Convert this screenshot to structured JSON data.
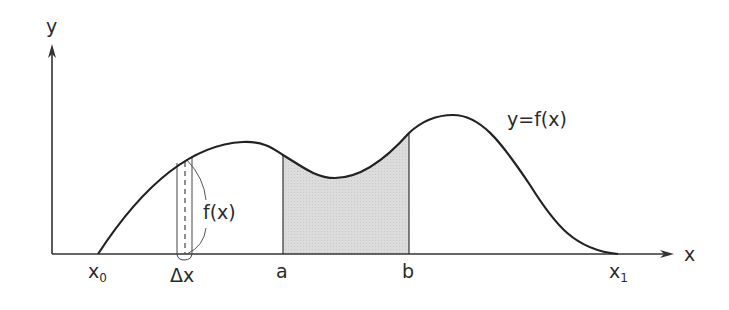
{
  "diagram": {
    "type": "definite-integral-area-illustration",
    "axes": {
      "x_label": "x",
      "y_label": "y"
    },
    "curve_label": "y=f(x)",
    "x_markers": [
      {
        "id": "x0",
        "base": "x",
        "subscript": "0"
      },
      {
        "id": "dx",
        "text": "Δx"
      },
      {
        "id": "a",
        "text": "a"
      },
      {
        "id": "b",
        "text": "b"
      },
      {
        "id": "x1",
        "base": "x",
        "subscript": "1"
      }
    ],
    "strip_label": "f(x)",
    "shaded_region": {
      "from": "a",
      "to": "b",
      "fill": "#d8d8d8"
    },
    "colors": {
      "line": "#222222",
      "shade": "#d8d8d8",
      "background": "#ffffff"
    }
  }
}
